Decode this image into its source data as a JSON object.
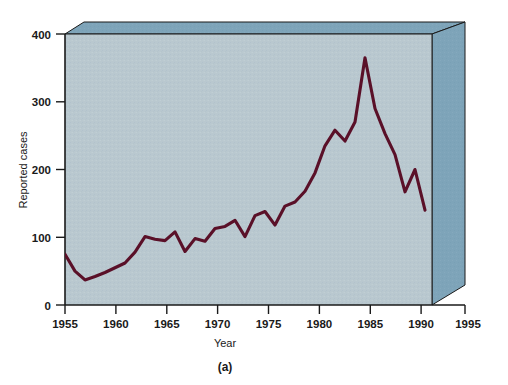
{
  "figure": {
    "caption": "(a)",
    "background_color": "#ffffff"
  },
  "colors": {
    "plot_face": "#b9c8cf",
    "plot_side": "#7ea4b9",
    "plot_top": "#6f98ae",
    "line": "#5a1028",
    "axis": "#1a1a1a",
    "text": "#1a1a1a"
  },
  "chart_data": {
    "type": "line",
    "title": "",
    "xlabel": "Year",
    "ylabel": "Reported cases",
    "xlim": [
      1955,
      1995
    ],
    "ylim": [
      0,
      400
    ],
    "xticks": [
      1955,
      1960,
      1965,
      1970,
      1975,
      1980,
      1985,
      1990,
      1995
    ],
    "xticklabels": [
      "1955",
      "1960",
      "1965",
      "1970",
      "1975",
      "1980",
      "1985",
      "1990",
      "1995"
    ],
    "yticks": [
      0,
      100,
      200,
      300,
      400
    ],
    "yticklabels": [
      "0",
      "100",
      "200",
      "300",
      "400"
    ],
    "grid": false,
    "legend": false,
    "series": [
      {
        "name": "Reported cases",
        "color": "#5a1028",
        "x": [
          1955,
          1956,
          1957,
          1958,
          1959,
          1960,
          1961,
          1962,
          1963,
          1964,
          1965,
          1966,
          1967,
          1968,
          1969,
          1970,
          1971,
          1972,
          1973,
          1974,
          1975,
          1976,
          1977,
          1978,
          1979,
          1980,
          1981,
          1982,
          1983,
          1984,
          1985,
          1986,
          1987,
          1988,
          1989,
          1990,
          1991
        ],
        "values": [
          75,
          50,
          37,
          42,
          48,
          55,
          62,
          78,
          101,
          97,
          95,
          108,
          79,
          98,
          94,
          113,
          116,
          125,
          101,
          132,
          138,
          118,
          146,
          152,
          168,
          195,
          235,
          258,
          242,
          270,
          365,
          290,
          253,
          222,
          167,
          200,
          140
        ]
      }
    ]
  }
}
